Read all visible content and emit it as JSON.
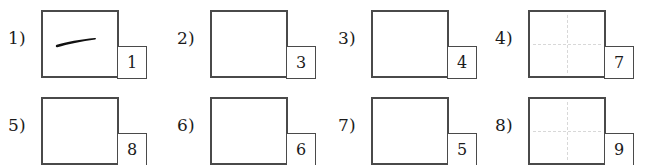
{
  "page": {
    "background_color": "#ffffff",
    "box_border_color": "#4a4a4a",
    "guide_color": "#d8d8d8",
    "ink_color": "#1b1b1b",
    "columns": 4,
    "rows": 2
  },
  "cells": [
    {
      "label": "1)",
      "badge": "1",
      "has_guides": false,
      "has_drawing": true,
      "drawing_name": "horizontal-brush-stroke"
    },
    {
      "label": "2)",
      "badge": "3",
      "has_guides": false,
      "has_drawing": false,
      "drawing_name": ""
    },
    {
      "label": "3)",
      "badge": "4",
      "has_guides": false,
      "has_drawing": false,
      "drawing_name": ""
    },
    {
      "label": "4)",
      "badge": "7",
      "has_guides": true,
      "has_drawing": false,
      "drawing_name": ""
    },
    {
      "label": "5)",
      "badge": "8",
      "has_guides": false,
      "has_drawing": false,
      "drawing_name": ""
    },
    {
      "label": "6)",
      "badge": "6",
      "has_guides": false,
      "has_drawing": false,
      "drawing_name": ""
    },
    {
      "label": "7)",
      "badge": "5",
      "has_guides": false,
      "has_drawing": false,
      "drawing_name": ""
    },
    {
      "label": "8)",
      "badge": "9",
      "has_guides": true,
      "has_drawing": false,
      "drawing_name": ""
    }
  ]
}
